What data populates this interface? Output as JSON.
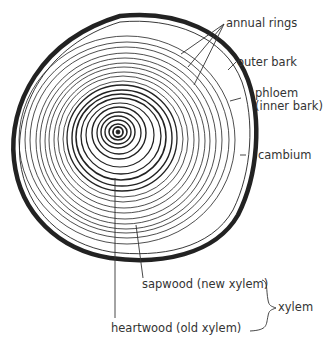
{
  "diagram": {
    "labels": {
      "annual_rings": "annual rings",
      "outer_bark": "outer bark",
      "phloem": "phloem",
      "phloem_sub": "(inner bark)",
      "cambium": "cambium",
      "sapwood": "sapwood (new xylem)",
      "heartwood": "heartwood (old xylem)",
      "xylem": "xylem"
    },
    "colors": {
      "ink": "#222222",
      "background": "#ffffff"
    }
  }
}
